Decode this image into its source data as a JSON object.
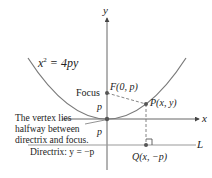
{
  "diagram": {
    "equation": "x² = 4py",
    "equation_base": "x",
    "equation_exp": "2",
    "equation_rest": " = 4py",
    "axis_x_label": "x",
    "axis_y_label": "y",
    "focus_word": "Focus",
    "focus_point": "F(0, p)",
    "point_p": "P(x, y)",
    "point_q": "Q(x, −p)",
    "line_label": "L",
    "dist_upper": "p",
    "dist_lower": "p",
    "vertex_note_line1": "The vertex lies",
    "vertex_note_line2": "halfway between",
    "vertex_note_line3": "directrix and focus.",
    "directrix_label": "Directrix: y = −p",
    "colors": {
      "curve": "#7a7a7a",
      "axis": "#555555",
      "point": "#555555",
      "text": "#222222",
      "line": "#9a9a9a"
    }
  }
}
